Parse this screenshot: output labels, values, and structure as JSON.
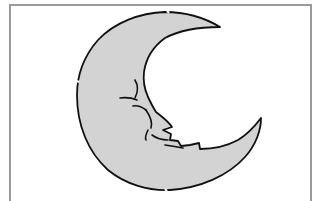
{
  "image": {
    "subject": "crescent-moon-with-face",
    "colors": {
      "fill": "#d3d3d3",
      "outline": "#111111",
      "frame": "#9a9a9a",
      "background": "#ffffff"
    }
  }
}
